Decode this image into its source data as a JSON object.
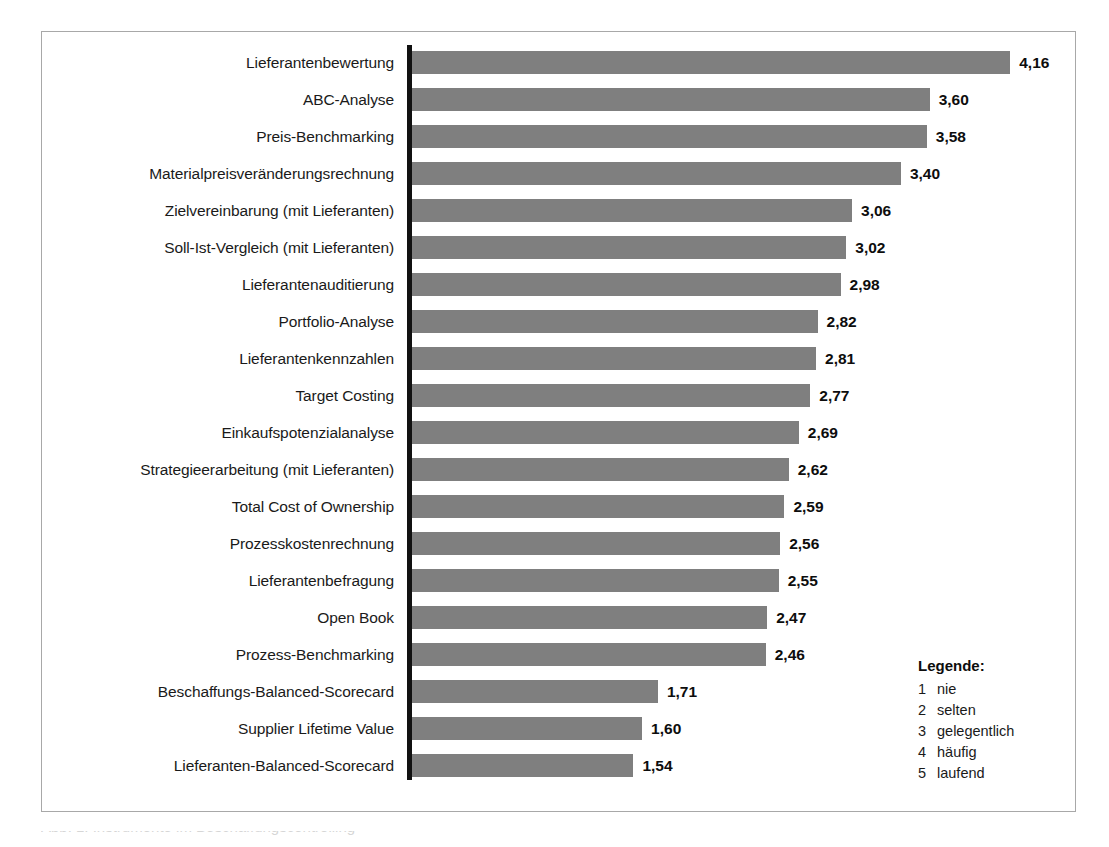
{
  "chart_data": {
    "type": "bar",
    "orientation": "horizontal",
    "title": "",
    "subtitle": "",
    "xlabel": "",
    "ylabel": "",
    "xlim": [
      0,
      4.16
    ],
    "grid": false,
    "value_format": "german-decimal-comma",
    "bar_color": "#7f7f7f",
    "axis_color": "#111111",
    "frame_color": "#a8a8a8",
    "legend_position": "bottom-right",
    "categories": [
      "Lieferantenbewertung",
      "ABC-Analyse",
      "Preis-Benchmarking",
      "Materialpreisveränderungsrechnung",
      "Zielvereinbarung (mit Lieferanten)",
      "Soll-Ist-Vergleich (mit Lieferanten)",
      "Lieferantenauditierung",
      "Portfolio-Analyse",
      "Lieferantenkennzahlen",
      "Target Costing",
      "Einkaufspotenzialanalyse",
      "Strategieerarbeitung (mit Lieferanten)",
      "Total Cost of Ownership",
      "Prozesskostenrechnung",
      "Lieferantenbefragung",
      "Open Book",
      "Prozess-Benchmarking",
      "Beschaffungs-Balanced-Scorecard",
      "Supplier Lifetime Value",
      "Lieferanten-Balanced-Scorecard"
    ],
    "values": [
      4.16,
      3.6,
      3.58,
      3.4,
      3.06,
      3.02,
      2.98,
      2.82,
      2.81,
      2.77,
      2.69,
      2.62,
      2.59,
      2.56,
      2.55,
      2.47,
      2.46,
      1.71,
      1.6,
      1.54
    ],
    "value_labels": [
      "4,16",
      "3,60",
      "3,58",
      "3,40",
      "3,06",
      "3,02",
      "2,98",
      "2,82",
      "2,81",
      "2,77",
      "2,69",
      "2,62",
      "2,59",
      "2,56",
      "2,55",
      "2,47",
      "2,46",
      "1,71",
      "1,60",
      "1,54"
    ]
  },
  "legend": {
    "title": "Legende:",
    "entries": [
      {
        "key": "1",
        "desc": "nie"
      },
      {
        "key": "2",
        "desc": "selten"
      },
      {
        "key": "3",
        "desc": "gelegentlich"
      },
      {
        "key": "4",
        "desc": "häufig"
      },
      {
        "key": "5",
        "desc": "laufend"
      }
    ]
  },
  "caption": {
    "text": "Abb. 1: Instrumente im Beschaffungscontrolling"
  }
}
